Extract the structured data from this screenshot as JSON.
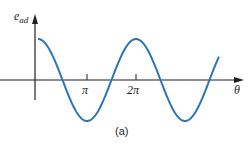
{
  "figure": {
    "caption": "(a)",
    "y_label_main": "e",
    "y_label_sub": "ad",
    "x_label": "θ",
    "ticks": [
      {
        "label": "π"
      },
      {
        "label": "2π"
      }
    ],
    "curve_color": "#2e75b6",
    "axis_color": "#231f20"
  },
  "chart_data": {
    "type": "line",
    "title": "",
    "xlabel": "θ",
    "ylabel": "e_ad",
    "x_tick_labels": [
      "π",
      "2π"
    ],
    "function": "cos(θ)",
    "x": [
      0,
      0.785,
      1.571,
      2.356,
      3.142,
      3.927,
      4.712,
      5.498,
      6.283,
      7.069,
      7.854,
      8.639,
      9.425,
      10.21,
      10.996,
      11.6
    ],
    "values": [
      1,
      0.707,
      0,
      -0.707,
      -1,
      -0.707,
      0,
      0.707,
      1,
      0.707,
      0,
      -0.707,
      -1,
      -0.707,
      0,
      0.57
    ],
    "grid": false,
    "legend": "none"
  }
}
